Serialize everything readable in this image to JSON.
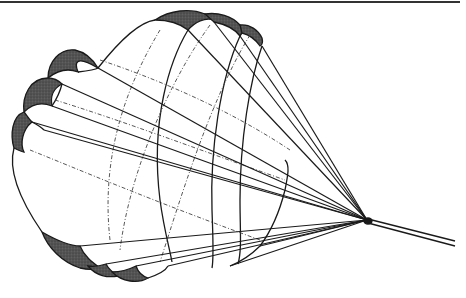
{
  "figure": {
    "colors": {
      "ink": "#1a1a1a",
      "shade": "#4a4a4a",
      "background": "#ffffff",
      "rule": "#333333"
    }
  }
}
